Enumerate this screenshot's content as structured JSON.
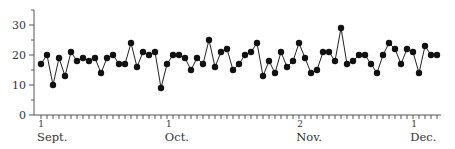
{
  "chart_data": {
    "type": "line",
    "title": "",
    "xlabel": "",
    "ylabel": "",
    "ylim": [
      0,
      35
    ],
    "grid": false,
    "legend": null,
    "marker": "filled-circle",
    "y_ticks": [
      0,
      10,
      20,
      30
    ],
    "x_month_labels": [
      {
        "day": "1",
        "month": "Sept.",
        "index": 0
      },
      {
        "day": "1",
        "month": "Oct.",
        "index": 21.3
      },
      {
        "day": "2",
        "month": "Nov.",
        "index": 43.2
      },
      {
        "day": "1",
        "month": "Dec.",
        "index": 62.2
      }
    ],
    "series": [
      {
        "name": "daily values",
        "values": [
          17,
          20,
          10,
          19,
          13,
          21,
          18,
          19,
          18,
          19,
          14,
          19,
          20,
          17,
          17,
          24,
          16,
          21,
          20,
          21,
          9,
          17,
          20,
          20,
          19,
          15,
          19,
          17,
          25,
          16,
          21,
          22,
          15,
          17,
          20,
          21,
          24,
          13,
          18,
          14,
          21,
          16,
          18,
          24,
          19,
          14,
          15,
          21,
          21,
          18,
          29,
          17,
          18,
          20,
          20,
          17,
          14,
          20,
          24,
          22,
          17,
          22,
          21,
          14,
          23,
          20,
          20
        ]
      }
    ]
  },
  "colors": {
    "line": "#222222",
    "marker": "#111111",
    "axis": "#555555"
  }
}
